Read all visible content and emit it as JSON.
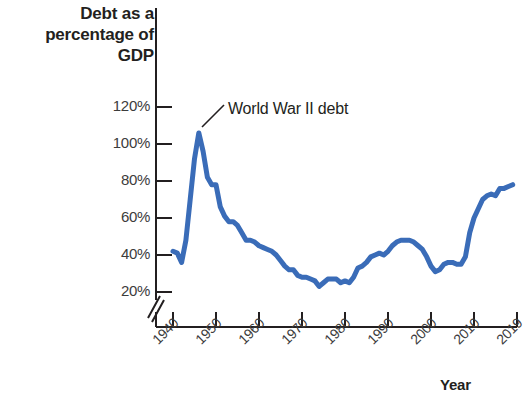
{
  "chart_data": {
    "type": "line",
    "title": "",
    "ylabel": "Debt as a\npercentage of\nGDP",
    "xlabel": "Year",
    "ylim": [
      20,
      130
    ],
    "xlim": [
      1940,
      2019
    ],
    "grid": false,
    "legend": null,
    "axis_break_y": true,
    "ytick_labels": [
      "120%",
      "100%",
      "80%",
      "60%",
      "40%",
      "20%"
    ],
    "ytick_values": [
      120,
      100,
      80,
      60,
      40,
      20
    ],
    "xtick_labels": [
      "1940",
      "1950",
      "1960",
      "1970",
      "1980",
      "1990",
      "2000",
      "2010",
      "2019"
    ],
    "xtick_values": [
      1940,
      1950,
      1960,
      1970,
      1980,
      1990,
      2000,
      2010,
      2019
    ],
    "series": [
      {
        "name": "Federal debt held by the public as a percentage of GDP",
        "color": "#3a6cb8",
        "x": [
          1940,
          1941,
          1942,
          1943,
          1944,
          1945,
          1946,
          1947,
          1948,
          1949,
          1950,
          1951,
          1952,
          1953,
          1954,
          1955,
          1956,
          1957,
          1958,
          1959,
          1960,
          1961,
          1962,
          1963,
          1964,
          1965,
          1966,
          1967,
          1968,
          1969,
          1970,
          1971,
          1972,
          1973,
          1974,
          1975,
          1976,
          1977,
          1978,
          1979,
          1980,
          1981,
          1982,
          1983,
          1984,
          1985,
          1986,
          1987,
          1988,
          1989,
          1990,
          1991,
          1992,
          1993,
          1994,
          1995,
          1996,
          1997,
          1998,
          1999,
          2000,
          2001,
          2002,
          2003,
          2004,
          2005,
          2006,
          2007,
          2008,
          2009,
          2010,
          2011,
          2012,
          2013,
          2014,
          2015,
          2016,
          2017,
          2018,
          2019
        ],
        "values": [
          42,
          41,
          36,
          48,
          70,
          92,
          106,
          96,
          82,
          78,
          78,
          66,
          61,
          58,
          58,
          56,
          52,
          48,
          48,
          47,
          45,
          44,
          43,
          42,
          40,
          37,
          34,
          32,
          32,
          29,
          28,
          28,
          27,
          26,
          23,
          25,
          27,
          27,
          27,
          25,
          26,
          25,
          28,
          33,
          34,
          36,
          39,
          40,
          41,
          40,
          42,
          45,
          47,
          48,
          48,
          48,
          47,
          45,
          43,
          39,
          34,
          31,
          32,
          35,
          36,
          36,
          35,
          35,
          39,
          52,
          60,
          65,
          70,
          72,
          73,
          72,
          76,
          76,
          77,
          78
        ]
      }
    ],
    "annotations": [
      {
        "text": "World War II debt",
        "points_to_year": 1946,
        "points_to_value": 107
      }
    ]
  }
}
